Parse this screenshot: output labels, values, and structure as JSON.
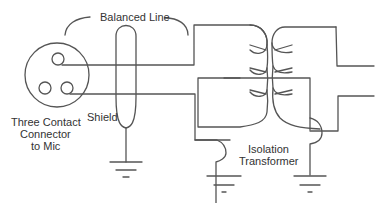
{
  "diagram": {
    "labels": {
      "balanced_line": "Balanced Line",
      "shield": "Shield",
      "connector_line1": "Three Contact",
      "connector_line2": "Connector",
      "connector_line3": "to Mic",
      "transformer_line1": "Isolation",
      "transformer_line2": "Transformer"
    },
    "components": [
      {
        "id": "connector",
        "type": "three-contact-connector",
        "contacts": 3
      },
      {
        "id": "shield",
        "type": "cable-shield",
        "grounded": true
      },
      {
        "id": "transformer",
        "type": "isolation-transformer",
        "primary_ground": true,
        "secondary_ground": true
      }
    ],
    "colors": {
      "line": "#555555",
      "text": "#333333",
      "background": "#ffffff"
    }
  }
}
